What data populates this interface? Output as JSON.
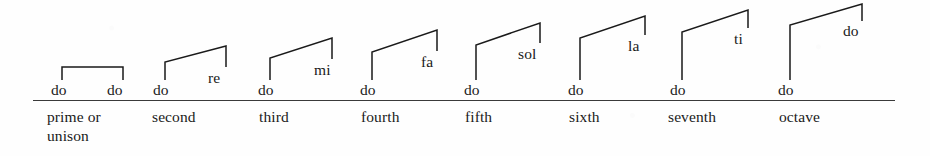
{
  "figure": {
    "kind": "music-interval-diagram",
    "ink_color": "#1a1a1a",
    "rule_color": "#3a3a3a",
    "background_color": "#fefefe",
    "baseline": {
      "x": 33,
      "y": 100,
      "width": 862
    }
  },
  "chart_data": {
    "type": "diagram",
    "title": "",
    "xlabel": "",
    "ylabel": "",
    "categories": [
      "prime or unison",
      "second",
      "third",
      "fourth",
      "fifth",
      "sixth",
      "seventh",
      "octave"
    ],
    "series": [
      {
        "name": "lower note",
        "values": [
          "do",
          "do",
          "do",
          "do",
          "do",
          "do",
          "do",
          "do"
        ]
      },
      {
        "name": "upper note",
        "values": [
          "do",
          "re",
          "mi",
          "fa",
          "sol",
          "la",
          "ti",
          "do"
        ]
      }
    ],
    "step_index": [
      0,
      1,
      2,
      3,
      4,
      5,
      6,
      7
    ],
    "values": [
      0,
      1,
      2,
      3,
      4,
      5,
      6,
      7
    ]
  },
  "groups": [
    {
      "name": "prime-or-unison",
      "interval_label": "prime or",
      "interval_label_line2": "unison",
      "interval_label_x": 47,
      "interval_label_y": 108,
      "left_note": "do",
      "left_note_x": 51,
      "left_note_y": 82,
      "right_note": "do",
      "right_note_x": 107,
      "right_note_y": 82,
      "left_stem_x": 62,
      "left_stem_bottom": 80,
      "left_stem_top": 67,
      "right_stem_x": 123,
      "right_stem_top": 67,
      "right_stem_bottom": 80
    },
    {
      "name": "second",
      "interval_label": "second",
      "interval_label_line2": "",
      "interval_label_x": 152,
      "interval_label_y": 108,
      "left_note": "do",
      "left_note_x": 153,
      "left_note_y": 82,
      "right_note": "re",
      "right_note_x": 208,
      "right_note_y": 70,
      "left_stem_x": 165,
      "left_stem_bottom": 80,
      "left_stem_top": 62,
      "right_stem_x": 226,
      "right_stem_top": 46,
      "right_stem_bottom": 67
    },
    {
      "name": "third",
      "interval_label": "third",
      "interval_label_line2": "",
      "interval_label_x": 259,
      "interval_label_y": 108,
      "left_note": "do",
      "left_note_x": 258,
      "left_note_y": 82,
      "right_note": "mi",
      "right_note_x": 314,
      "right_note_y": 62,
      "left_stem_x": 270,
      "left_stem_bottom": 80,
      "left_stem_top": 58,
      "right_stem_x": 332,
      "right_stem_top": 38,
      "right_stem_bottom": 59
    },
    {
      "name": "fourth",
      "interval_label": "fourth",
      "interval_label_line2": "",
      "interval_label_x": 361,
      "interval_label_y": 108,
      "left_note": "do",
      "left_note_x": 360,
      "left_note_y": 82,
      "right_note": "fa",
      "right_note_x": 421,
      "right_note_y": 54,
      "left_stem_x": 372,
      "left_stem_bottom": 80,
      "left_stem_top": 52,
      "right_stem_x": 437,
      "right_stem_top": 30,
      "right_stem_bottom": 51
    },
    {
      "name": "fifth",
      "interval_label": "fifth",
      "interval_label_line2": "",
      "interval_label_x": 465,
      "interval_label_y": 108,
      "left_note": "do",
      "left_note_x": 464,
      "left_note_y": 82,
      "right_note": "sol",
      "right_note_x": 518,
      "right_note_y": 46,
      "left_stem_x": 476,
      "left_stem_bottom": 80,
      "left_stem_top": 45,
      "right_stem_x": 540,
      "right_stem_top": 23,
      "right_stem_bottom": 43
    },
    {
      "name": "sixth",
      "interval_label": "sixth",
      "interval_label_line2": "",
      "interval_label_x": 569,
      "interval_label_y": 108,
      "left_note": "do",
      "left_note_x": 568,
      "left_note_y": 82,
      "right_note": "la",
      "right_note_x": 628,
      "right_note_y": 38,
      "left_stem_x": 580,
      "left_stem_bottom": 80,
      "left_stem_top": 38,
      "right_stem_x": 645,
      "right_stem_top": 16,
      "right_stem_bottom": 35
    },
    {
      "name": "seventh",
      "interval_label": "seventh",
      "interval_label_line2": "",
      "interval_label_x": 668,
      "interval_label_y": 108,
      "left_note": "do",
      "left_note_x": 670,
      "left_note_y": 82,
      "right_note": "ti",
      "right_note_x": 734,
      "right_note_y": 31,
      "left_stem_x": 682,
      "left_stem_bottom": 80,
      "left_stem_top": 32,
      "right_stem_x": 748,
      "right_stem_top": 10,
      "right_stem_bottom": 28
    },
    {
      "name": "octave",
      "interval_label": "octave",
      "interval_label_line2": "",
      "interval_label_x": 779,
      "interval_label_y": 108,
      "left_note": "do",
      "left_note_x": 778,
      "left_note_y": 82,
      "right_note": "do",
      "right_note_x": 843,
      "right_note_y": 23,
      "left_stem_x": 790,
      "left_stem_bottom": 80,
      "left_stem_top": 25,
      "right_stem_x": 862,
      "right_stem_top": 4,
      "right_stem_bottom": 21
    }
  ]
}
